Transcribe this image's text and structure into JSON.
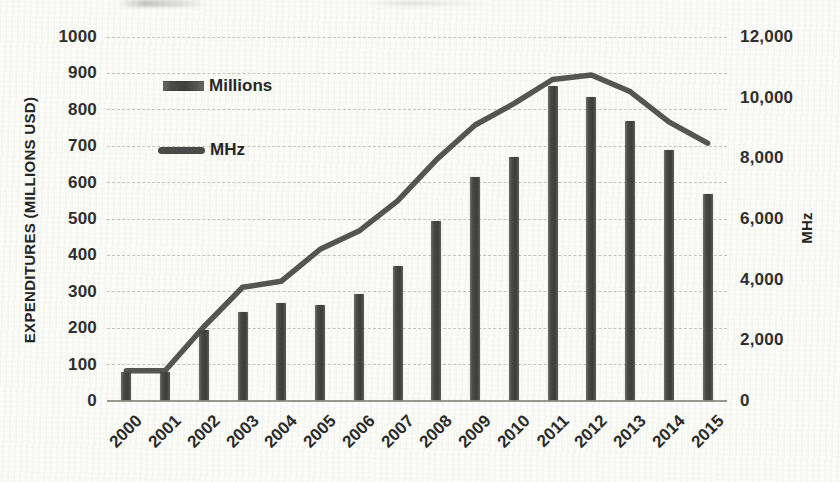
{
  "chart_data": {
    "type": "combo-bar-line",
    "title": "",
    "categories": [
      "2000",
      "2001",
      "2002",
      "2003",
      "2004",
      "2005",
      "2006",
      "2007",
      "2008",
      "2009",
      "2010",
      "2011",
      "2012",
      "2013",
      "2014",
      "2015"
    ],
    "series": [
      {
        "name": "Millions",
        "type": "bar",
        "axis": "left",
        "values": [
          80,
          80,
          195,
          245,
          270,
          265,
          295,
          370,
          495,
          615,
          670,
          865,
          835,
          770,
          690,
          570
        ]
      },
      {
        "name": "MHz",
        "type": "line",
        "axis": "right",
        "values": [
          1000,
          1000,
          2450,
          3750,
          3950,
          5000,
          5600,
          6600,
          7950,
          9100,
          9800,
          10600,
          10750,
          10200,
          9200,
          8500
        ]
      }
    ],
    "left_axis": {
      "label": "EXPENDITURES (MILLIONS USD)",
      "min": 0,
      "max": 1000,
      "tick_labels": [
        "0",
        "100",
        "200",
        "300",
        "400",
        "500",
        "600",
        "700",
        "800",
        "900",
        "1000"
      ]
    },
    "right_axis": {
      "label": "MHz",
      "min": 0,
      "max": 12000,
      "tick_labels": [
        "0",
        "2,000",
        "4,000",
        "6,000",
        "8,000",
        "10,000",
        "12,000"
      ]
    },
    "legend": [
      {
        "label": "Millions",
        "swatch": "bar"
      },
      {
        "label": "MHz",
        "swatch": "line"
      }
    ],
    "grid": true,
    "legend_position": "inside-top-left",
    "colors": {
      "bar": "#474745",
      "line": "#474745",
      "gridline": "#bcbcb4",
      "axis_line": "#8e8e86",
      "text": "#2a2a28",
      "paper": "#fbfbf8"
    }
  }
}
